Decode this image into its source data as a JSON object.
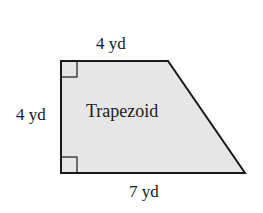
{
  "diagram": {
    "shape": "Trapezoid",
    "labels": {
      "top": "4 yd",
      "left": "4 yd",
      "center": "Trapezoid",
      "bottom": "7 yd"
    },
    "colors": {
      "fill": "#e6e6e6",
      "stroke": "#1a1a1a",
      "background": "#ffffff"
    },
    "right_angle_markers": [
      "top-left",
      "bottom-left"
    ]
  }
}
